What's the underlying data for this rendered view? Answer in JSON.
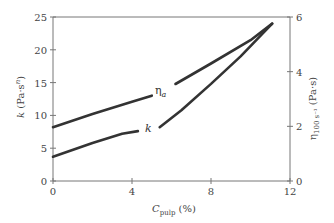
{
  "chart_data": {
    "type": "line",
    "title": "",
    "xlabel": "C_pulp (%)",
    "xlabel_main": "C",
    "xlabel_sub": "pulp",
    "xlabel_unit": " (%)",
    "ylabel_left": "k (Pa·s^n)",
    "ylabel_left_main": "k",
    "ylabel_left_unit": " (Pa·s",
    "ylabel_left_sup": "n",
    "ylabel_left_close": ")",
    "ylabel_right": "η_100 s⁻¹ (Pa·s)",
    "ylabel_right_main": "η",
    "ylabel_right_sub": "100 s⁻¹",
    "ylabel_right_unit": " (Pa·s)",
    "xlim": [
      0,
      12
    ],
    "ylim_left": [
      0,
      25
    ],
    "ylim_right": [
      0,
      6
    ],
    "x_ticks": [
      "0",
      "4",
      "8",
      "12"
    ],
    "y_left_ticks": [
      "0",
      "5",
      "10",
      "15",
      "20",
      "25"
    ],
    "y_right_ticks": [
      "0",
      "2",
      "4",
      "6"
    ],
    "grid": false,
    "series": [
      {
        "name": "η_a",
        "label_main": "η",
        "label_sub": "a",
        "axis": "right",
        "points": [
          [
            0,
            1.97
          ],
          [
            2,
            2.45
          ],
          [
            4,
            2.9
          ],
          [
            5,
            3.12
          ],
          [
            6.2,
            3.55
          ],
          [
            8,
            4.3
          ],
          [
            10,
            5.15
          ],
          [
            11.1,
            5.76
          ]
        ]
      },
      {
        "name": "k",
        "label_main": "k",
        "axis": "left",
        "points": [
          [
            0,
            3.7
          ],
          [
            2,
            5.8
          ],
          [
            3.5,
            7.2
          ],
          [
            4.3,
            7.6
          ],
          [
            5.4,
            8.2
          ],
          [
            6.5,
            10.8
          ],
          [
            8,
            14.8
          ],
          [
            9.5,
            19.0
          ],
          [
            11.1,
            24.0
          ]
        ]
      }
    ]
  }
}
